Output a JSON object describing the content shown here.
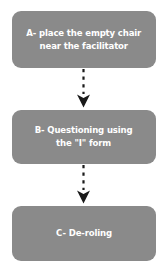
{
  "diagram": {
    "orientation": "vertical-top-to-bottom",
    "background_color": "#ffffff",
    "node_fill_color": "#8a8a8a",
    "node_text_color": "#ffffff",
    "connector_color": "#1a1a1a",
    "connector_style": "dashed-line-with-solid-arrowhead",
    "nodes": [
      {
        "id": "a",
        "label": "A- place the empty chair\nnear the facilitator",
        "shape": "rounded-rectangle"
      },
      {
        "id": "b",
        "label": "B- Questioning using\nthe \"I\" form",
        "shape": "rounded-rectangle"
      },
      {
        "id": "c",
        "label": "C- De-roling",
        "shape": "rounded-rectangle"
      }
    ],
    "connectors": [
      {
        "id": "1",
        "from": "a",
        "to": "b",
        "icon": "dashed-arrow-down-icon"
      },
      {
        "id": "2",
        "from": "b",
        "to": "c",
        "icon": "dashed-arrow-down-icon"
      }
    ]
  }
}
